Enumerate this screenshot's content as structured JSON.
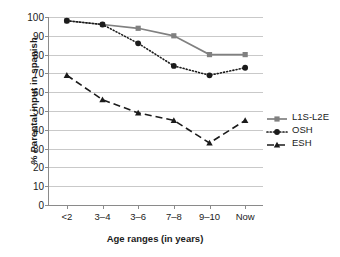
{
  "chart_data": {
    "type": "line",
    "title": "",
    "xlabel": "Age ranges (in years)",
    "ylabel": "% Parental input in spanish",
    "categories": [
      "<2",
      "3–4",
      "3–6",
      "7–8",
      "9–10",
      "Now"
    ],
    "ylim": [
      0,
      100
    ],
    "ytick_step": 10,
    "yticks": [
      0,
      10,
      20,
      30,
      40,
      50,
      60,
      70,
      80,
      90,
      100
    ],
    "grid": "horizontal",
    "legend_position": "right",
    "series": [
      {
        "name": "L1S-L2E",
        "values": [
          98,
          96,
          94,
          90,
          80,
          80
        ],
        "color": "#808080",
        "line_style": "solid",
        "marker": "square"
      },
      {
        "name": "OSH",
        "values": [
          98,
          96,
          86,
          74,
          69,
          73
        ],
        "color": "#1b1b1b",
        "line_style": "dotted",
        "marker": "circle"
      },
      {
        "name": "ESH",
        "values": [
          69,
          56,
          49,
          45,
          33,
          45
        ],
        "color": "#1b1b1b",
        "line_style": "dashed",
        "marker": "triangle"
      }
    ]
  },
  "legend": {
    "items": [
      {
        "label": "L1S-L2E"
      },
      {
        "label": "OSH"
      },
      {
        "label": "ESH"
      }
    ]
  }
}
